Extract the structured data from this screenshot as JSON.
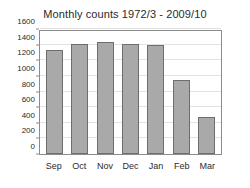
{
  "chart_data": {
    "type": "bar",
    "title": "Monthly counts 1972/3 - 2009/10",
    "xlabel": "",
    "ylabel": "",
    "categories": [
      "Sep",
      "Oct",
      "Nov",
      "Dec",
      "Jan",
      "Feb",
      "Mar"
    ],
    "values": [
      1330,
      1410,
      1440,
      1410,
      1395,
      950,
      480
    ],
    "ylim": [
      0,
      1600
    ],
    "ytick_labels": [
      "0",
      "200",
      "400",
      "600",
      "800",
      "1000",
      "1200",
      "1400",
      "1600"
    ],
    "ytick_values": [
      0,
      200,
      400,
      600,
      800,
      1000,
      1200,
      1400,
      1600
    ],
    "grid": true,
    "legend": null,
    "legend_position": "none",
    "bar_color": "#a9a9a9",
    "bar_edge_color": "#6e6e6e",
    "axis_color": "#8c8c8c",
    "grid_color": "#e2e2e2",
    "text_color": "#2b2b2b",
    "background_color": "#ffffff"
  }
}
